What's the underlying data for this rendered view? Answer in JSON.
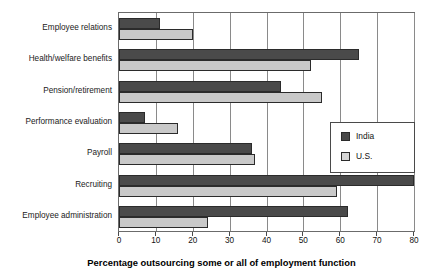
{
  "chart_data": {
    "type": "bar",
    "orientation": "horizontal",
    "title": "",
    "xlabel": "Percentage outsourcing some or all of employment function",
    "ylabel": "",
    "xlim": [
      0,
      80
    ],
    "xticks": [
      0,
      10,
      20,
      30,
      40,
      50,
      60,
      70,
      80
    ],
    "xtick_labels": [
      "0",
      "10",
      "20",
      "30",
      "40",
      "50",
      "60",
      "70",
      "80"
    ],
    "grid": true,
    "grid_axis": "x",
    "legend_position": "center-right",
    "categories": [
      "Employee relations",
      "Health/welfare benefits",
      "Pension/retirement",
      "Performance evaluation",
      "Payroll",
      "Recruiting",
      "Employee administration"
    ],
    "series": [
      {
        "name": "India",
        "color": "#4a4a4a",
        "values": [
          11,
          65,
          44,
          7,
          36,
          80,
          62
        ]
      },
      {
        "name": "U.S.",
        "color": "#c9c9c9",
        "values": [
          20,
          52,
          55,
          16,
          37,
          59,
          24
        ]
      }
    ]
  },
  "legend": {
    "entries": [
      {
        "label": "India",
        "color": "#4a4a4a"
      },
      {
        "label": "U.S.",
        "color": "#d5d5d5"
      }
    ]
  },
  "axis_title": "Percentage outsourcing some or all of employment function"
}
